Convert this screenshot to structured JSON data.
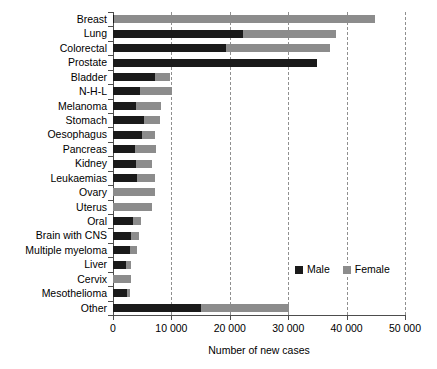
{
  "chart_data": {
    "type": "bar",
    "orientation": "horizontal",
    "stacked": true,
    "title": "",
    "xlabel": "Number of new cases",
    "ylabel": "",
    "xlim": [
      0,
      50000
    ],
    "xticks": [
      0,
      10000,
      20000,
      30000,
      40000,
      50000
    ],
    "xticklabels": [
      "0",
      "10 000",
      "20 000",
      "30 000",
      "40 000",
      "50 000"
    ],
    "grid": "vertical-dashed",
    "legend_position": "inside-lower-right",
    "categories": [
      "Breast",
      "Lung",
      "Colorectal",
      "Prostate",
      "Bladder",
      "N-H-L",
      "Melanoma",
      "Stomach",
      "Oesophagus",
      "Pancreas",
      "Kidney",
      "Leukaemias",
      "Ovary",
      "Uterus",
      "Oral",
      "Brain with CNS",
      "Multiple myeloma",
      "Liver",
      "Cervix",
      "Mesothelioma",
      "Other"
    ],
    "series": [
      {
        "name": "Male",
        "color": "#1a1a1a",
        "values": [
          200,
          22200,
          19400,
          35000,
          7200,
          4600,
          3900,
          5300,
          5000,
          3800,
          4000,
          4100,
          0,
          0,
          3400,
          3100,
          2900,
          2200,
          0,
          2400,
          15000
        ]
      },
      {
        "name": "Female",
        "color": "#8c8c8c",
        "values": [
          44700,
          16000,
          17800,
          0,
          2600,
          5500,
          4300,
          2700,
          2200,
          3600,
          2700,
          3100,
          7200,
          6700,
          1400,
          1300,
          1200,
          900,
          3100,
          500,
          15200
        ]
      }
    ],
    "totals": [
      44900,
      38200,
      37200,
      35000,
      9800,
      10100,
      8200,
      8000,
      7200,
      7400,
      6700,
      7200,
      7200,
      6700,
      4800,
      4400,
      4100,
      3100,
      3100,
      2900,
      30200
    ]
  },
  "legend": {
    "items": [
      {
        "label": "Male",
        "color": "#1a1a1a"
      },
      {
        "label": "Female",
        "color": "#8c8c8c"
      }
    ]
  }
}
